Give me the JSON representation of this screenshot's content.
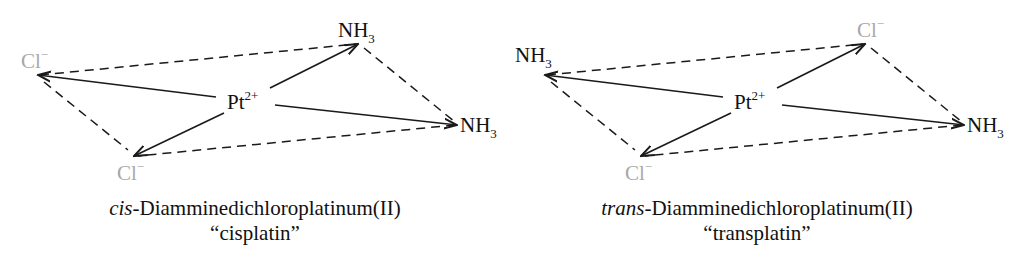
{
  "colors": {
    "ligand_dark": "#111111",
    "ligand_chloride": "#a8a8a8",
    "bond": "#1a1a1a"
  },
  "cis": {
    "center": {
      "symbol": "Pt",
      "charge": "2+"
    },
    "ligands": {
      "left": {
        "symbol": "Cl",
        "charge": "−",
        "subscript": ""
      },
      "bottom": {
        "symbol": "Cl",
        "charge": "−",
        "subscript": ""
      },
      "top": {
        "symbol": "NH",
        "charge": "",
        "subscript": "3"
      },
      "right": {
        "symbol": "NH",
        "charge": "",
        "subscript": "3"
      }
    },
    "caption": {
      "prefix": "cis",
      "name": "-Diamminedichloroplatinum(II)",
      "common_name": "“cisplatin”"
    }
  },
  "trans": {
    "center": {
      "symbol": "Pt",
      "charge": "2+"
    },
    "ligands": {
      "left": {
        "symbol": "NH",
        "charge": "",
        "subscript": "3"
      },
      "bottom": {
        "symbol": "Cl",
        "charge": "−",
        "subscript": ""
      },
      "top": {
        "symbol": "Cl",
        "charge": "−",
        "subscript": ""
      },
      "right": {
        "symbol": "NH",
        "charge": "",
        "subscript": "3"
      }
    },
    "caption": {
      "prefix": "trans",
      "name": "-Diamminedichloroplatinum(II)",
      "common_name": "“transplatin”"
    }
  }
}
